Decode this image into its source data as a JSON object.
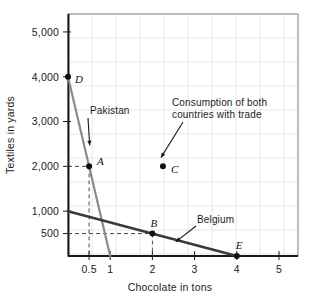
{
  "chart_data": {
    "type": "line",
    "title": "",
    "xlabel": "Chocolate in tons",
    "ylabel": "Textiles in yards",
    "xlim": [
      0,
      5.45
    ],
    "ylim": [
      0,
      5400
    ],
    "grid": true,
    "legend": "inline-annotations",
    "xticks": [
      {
        "value": 0.5,
        "label": "0.5"
      },
      {
        "value": 1,
        "label": "1"
      },
      {
        "value": 2,
        "label": "2"
      },
      {
        "value": 3,
        "label": "3"
      },
      {
        "value": 4,
        "label": "4"
      },
      {
        "value": 5,
        "label": "5"
      }
    ],
    "yticks": [
      {
        "value": 500,
        "label": "500"
      },
      {
        "value": 1000,
        "label": "1,000"
      },
      {
        "value": 2000,
        "label": "2,000"
      },
      {
        "value": 3000,
        "label": "3,000"
      },
      {
        "value": 4000,
        "label": "4,000"
      },
      {
        "value": 5000,
        "label": "5,000"
      }
    ],
    "series": [
      {
        "name": "Pakistan",
        "color": "#8a8a8a",
        "x": [
          0,
          1
        ],
        "y": [
          4000,
          0
        ],
        "endpoints_labeled": [
          "D",
          ""
        ]
      },
      {
        "name": "Belgium",
        "color": "#3a3a3a",
        "x": [
          0,
          4
        ],
        "y": [
          1000,
          0
        ],
        "endpoints_labeled": [
          "",
          "E"
        ]
      }
    ],
    "points": [
      {
        "label": "D",
        "x": 0,
        "y": 4000
      },
      {
        "label": "A",
        "x": 0.5,
        "y": 2000
      },
      {
        "label": "C",
        "x": 2.25,
        "y": 2000
      },
      {
        "label": "B",
        "x": 2,
        "y": 500
      },
      {
        "label": "E",
        "x": 4,
        "y": 0
      }
    ],
    "guide_lines": [
      {
        "from": [
          0,
          2000
        ],
        "to": [
          0.5,
          2000
        ],
        "style": "dashed"
      },
      {
        "from": [
          0.5,
          2000
        ],
        "to": [
          0.5,
          0
        ],
        "style": "dashed"
      },
      {
        "from": [
          0,
          500
        ],
        "to": [
          2,
          500
        ],
        "style": "dashed"
      },
      {
        "from": [
          2,
          500
        ],
        "to": [
          2,
          0
        ],
        "style": "dashed"
      }
    ],
    "annotations": [
      {
        "name": "pakistan-label",
        "text": "Pakistan",
        "points_to": [
          0.42,
          2600
        ]
      },
      {
        "name": "consumption-label",
        "line1": "Consumption of both",
        "line2": "countries with trade",
        "points_to": [
          2.25,
          2150
        ]
      },
      {
        "name": "belgium-label",
        "text": "Belgium",
        "points_to": [
          2.6,
          360
        ]
      }
    ],
    "colors": {
      "pakistan_line": "#8a8a8a",
      "belgium_line": "#3a3a3a",
      "frame": "#5a5a5a",
      "grid": "#e7e7ec",
      "axis": "#1a1a1a",
      "dash": "#4a4a4a",
      "text": "#1c1c1c"
    }
  }
}
